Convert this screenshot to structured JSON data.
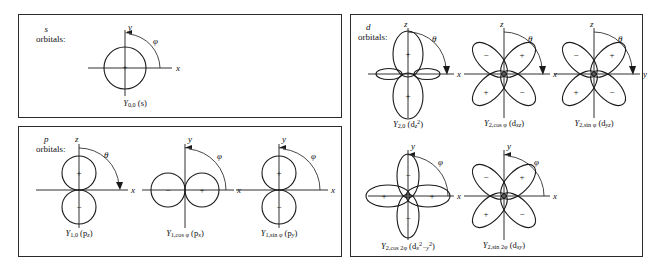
{
  "figure": {
    "sections": [
      {
        "id": "s",
        "letter": "s",
        "word": "orbitals:"
      },
      {
        "id": "p",
        "letter": "p",
        "word": "orbitals:"
      },
      {
        "id": "d",
        "letter": "d",
        "word": "orbitals:"
      }
    ]
  },
  "orbitals": {
    "s_00": {
      "label_Y": "Y",
      "label_sub": "0,0",
      "label_paren": "(s)",
      "axes": {
        "vertical": "y",
        "horizontal": "x"
      },
      "angle": "φ",
      "signs": [
        "+"
      ],
      "shape": "sphere"
    },
    "p_z": {
      "label_Y": "Y",
      "label_sub": "1,0",
      "label_paren": "(p",
      "label_paren_sub": "z",
      "label_paren_end": ")",
      "axes": {
        "vertical": "z",
        "horizontal": "x"
      },
      "angle": "θ",
      "signs": {
        "top": "+",
        "bottom": "−"
      },
      "shape": "two-lobe-vertical"
    },
    "p_x": {
      "label_Y": "Y",
      "label_sub": "1,cos φ",
      "label_paren": "(p",
      "label_paren_sub": "x",
      "label_paren_end": ")",
      "axes": {
        "vertical": "y",
        "horizontal": "x"
      },
      "angle": "φ",
      "signs": {
        "left": "−",
        "right": "+"
      },
      "shape": "two-lobe-horizontal"
    },
    "p_y": {
      "label_Y": "Y",
      "label_sub": "1,sin φ",
      "label_paren": "(p",
      "label_paren_sub": "y",
      "label_paren_end": ")",
      "axes": {
        "vertical": "y",
        "horizontal": "x"
      },
      "angle": "φ",
      "signs": {
        "top": "+",
        "bottom": "−"
      },
      "shape": "two-lobe-vertical"
    },
    "d_z2": {
      "label_Y": "Y",
      "label_sub": "2,0",
      "label_paren": "(d",
      "label_paren_sub": "z",
      "label_paren_sup": "2",
      "label_paren_end": ")",
      "axes": {
        "vertical": "z",
        "horizontal": "x"
      },
      "angle": "θ",
      "signs": {
        "top": "+",
        "bottom": "+",
        "waist": "−"
      },
      "shape": "dz2"
    },
    "d_xz": {
      "label_Y": "Y",
      "label_sub": "2,cos φ",
      "label_paren": "(d",
      "label_paren_sub": "xz",
      "label_paren_end": ")",
      "axes": {
        "vertical": "z",
        "horizontal": "x"
      },
      "angle": "θ",
      "signs": {
        "upper_left": "−",
        "upper_right": "+",
        "lower_left": "+",
        "lower_right": "−"
      },
      "shape": "four-lobe-diagonal"
    },
    "d_yz": {
      "label_Y": "Y",
      "label_sub": "2,sin φ",
      "label_paren": "(d",
      "label_paren_sub": "yz",
      "label_paren_end": ")",
      "axes": {
        "vertical": "z",
        "horizontal": "y"
      },
      "angle": "θ",
      "signs": {
        "upper_left": "−",
        "upper_right": "+",
        "lower_left": "+",
        "lower_right": "−"
      },
      "shape": "four-lobe-diagonal"
    },
    "d_x2y2": {
      "label_Y": "Y",
      "label_sub": "2,cos 2φ",
      "label_paren": "(d",
      "label_paren_sub": "x",
      "label_paren_sup": "2",
      "label_paren_mid": "−y",
      "label_paren_sup2": "2",
      "label_paren_end": ")",
      "axes": {
        "vertical": "y",
        "horizontal": "x"
      },
      "angle": "φ",
      "signs": {
        "left": "+",
        "right": "+",
        "top": "−",
        "bottom": "−"
      },
      "shape": "four-lobe-axial"
    },
    "d_xy": {
      "label_Y": "Y",
      "label_sub": "2,sin 2φ",
      "label_paren": "(d",
      "label_paren_sub": "xy",
      "label_paren_end": ")",
      "axes": {
        "vertical": "y",
        "horizontal": "x"
      },
      "angle": "φ",
      "signs": {
        "upper_left": "−",
        "upper_right": "+",
        "lower_left": "+",
        "lower_right": "−"
      },
      "shape": "four-lobe-diagonal"
    }
  },
  "colors": {
    "ink": "#1a1a1a",
    "border": "#2b2b2b",
    "background": "#ffffff"
  }
}
